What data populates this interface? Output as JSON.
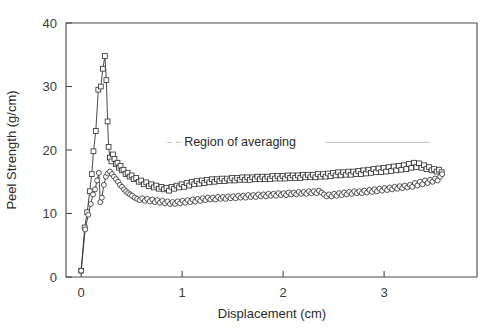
{
  "chart_data": {
    "type": "line",
    "title": "",
    "xlabel": "Displacement (cm)",
    "ylabel": "Peel Strength (g/cm)",
    "xlim": [
      -0.15,
      3.92
    ],
    "ylim": [
      0,
      40
    ],
    "xticks": [
      0,
      1,
      2,
      3
    ],
    "xticklabels": [
      "0",
      "1",
      "2",
      "3"
    ],
    "yticks": [
      0,
      10,
      20,
      30,
      40
    ],
    "yticklabels": [
      "0",
      "10",
      "20",
      "30",
      "40"
    ],
    "grid": false,
    "legend": "none",
    "annotations": [
      {
        "text": "Region of averaging",
        "x": 1.02,
        "y": 21.2,
        "leader_line": true,
        "leader_from_x": 0.85,
        "leader_to_x": 1.0,
        "tail_from_x": 2.42,
        "tail_to_x": 3.45,
        "line_y": 21.2
      }
    ],
    "series": [
      {
        "name": "squares",
        "marker": "square",
        "x": [
          0.0,
          0.035,
          0.06,
          0.085,
          0.105,
          0.122,
          0.145,
          0.17,
          0.195,
          0.215,
          0.235,
          0.25,
          0.262,
          0.272,
          0.285,
          0.3,
          0.315,
          0.33,
          0.345,
          0.36,
          0.375,
          0.39,
          0.405,
          0.42,
          0.44,
          0.46,
          0.48,
          0.5,
          0.52,
          0.545,
          0.57,
          0.595,
          0.62,
          0.645,
          0.67,
          0.695,
          0.72,
          0.745,
          0.77,
          0.795,
          0.82,
          0.845,
          0.87,
          0.895,
          0.92,
          0.945,
          0.97,
          0.995,
          1.02,
          1.045,
          1.07,
          1.095,
          1.12,
          1.145,
          1.17,
          1.195,
          1.22,
          1.245,
          1.27,
          1.295,
          1.32,
          1.345,
          1.37,
          1.395,
          1.42,
          1.445,
          1.47,
          1.495,
          1.52,
          1.545,
          1.57,
          1.595,
          1.62,
          1.645,
          1.67,
          1.695,
          1.72,
          1.745,
          1.77,
          1.795,
          1.82,
          1.845,
          1.87,
          1.895,
          1.92,
          1.945,
          1.97,
          1.995,
          2.02,
          2.045,
          2.07,
          2.095,
          2.12,
          2.145,
          2.17,
          2.195,
          2.22,
          2.245,
          2.27,
          2.295,
          2.32,
          2.345,
          2.37,
          2.395,
          2.42,
          2.445,
          2.47,
          2.495,
          2.52,
          2.545,
          2.57,
          2.595,
          2.62,
          2.645,
          2.67,
          2.695,
          2.72,
          2.745,
          2.77,
          2.795,
          2.82,
          2.845,
          2.87,
          2.895,
          2.92,
          2.945,
          2.97,
          2.995,
          3.02,
          3.045,
          3.07,
          3.095,
          3.12,
          3.145,
          3.17,
          3.195,
          3.22,
          3.245,
          3.27,
          3.295,
          3.32,
          3.345,
          3.37,
          3.395,
          3.42,
          3.445,
          3.47,
          3.495,
          3.52,
          3.545,
          3.57
        ],
        "y": [
          1.0,
          7.8,
          10.2,
          13.5,
          16.2,
          19.8,
          23.0,
          29.5,
          30.0,
          32.8,
          34.8,
          31.0,
          24.5,
          20.5,
          18.8,
          18.2,
          19.3,
          18.6,
          17.8,
          18.0,
          17.2,
          17.5,
          16.8,
          16.9,
          16.2,
          16.4,
          15.8,
          16.0,
          15.4,
          15.6,
          15.0,
          15.2,
          14.6,
          14.9,
          14.3,
          14.6,
          14.1,
          14.4,
          13.9,
          14.2,
          13.8,
          14.0,
          13.6,
          14.2,
          13.9,
          14.4,
          14.1,
          14.6,
          14.2,
          14.8,
          14.4,
          15.0,
          14.6,
          15.1,
          14.7,
          15.2,
          14.8,
          15.3,
          14.9,
          15.4,
          15.0,
          15.4,
          15.1,
          15.5,
          15.1,
          15.5,
          15.2,
          15.6,
          15.2,
          15.6,
          15.3,
          15.7,
          15.3,
          15.7,
          15.3,
          15.7,
          15.4,
          15.8,
          15.4,
          15.8,
          15.4,
          15.8,
          15.4,
          15.9,
          15.5,
          15.9,
          15.5,
          15.9,
          15.5,
          16.0,
          15.6,
          16.0,
          15.6,
          16.0,
          15.6,
          16.1,
          15.7,
          16.1,
          15.7,
          16.1,
          15.7,
          16.2,
          15.8,
          16.2,
          15.8,
          16.3,
          15.9,
          16.4,
          16.0,
          16.5,
          16.0,
          16.5,
          16.1,
          16.6,
          16.1,
          16.6,
          16.2,
          16.7,
          16.2,
          16.8,
          16.3,
          16.9,
          16.4,
          17.0,
          16.5,
          17.1,
          16.5,
          17.2,
          16.6,
          17.3,
          16.7,
          17.4,
          16.8,
          17.5,
          16.9,
          17.6,
          17.0,
          17.8,
          17.2,
          18.0,
          17.3,
          17.9,
          17.2,
          17.6,
          17.0,
          17.3,
          16.8,
          17.0,
          16.6,
          16.9,
          16.5
        ]
      },
      {
        "name": "circles",
        "marker": "circle",
        "x": [
          0.0,
          0.04,
          0.07,
          0.095,
          0.118,
          0.138,
          0.158,
          0.175,
          0.19,
          0.205,
          0.225,
          0.245,
          0.265,
          0.285,
          0.305,
          0.325,
          0.345,
          0.365,
          0.385,
          0.405,
          0.425,
          0.445,
          0.465,
          0.485,
          0.505,
          0.53,
          0.555,
          0.58,
          0.605,
          0.63,
          0.655,
          0.68,
          0.705,
          0.73,
          0.755,
          0.78,
          0.805,
          0.83,
          0.855,
          0.88,
          0.905,
          0.93,
          0.955,
          0.98,
          1.005,
          1.03,
          1.055,
          1.08,
          1.105,
          1.13,
          1.155,
          1.18,
          1.205,
          1.23,
          1.255,
          1.28,
          1.305,
          1.33,
          1.355,
          1.38,
          1.405,
          1.43,
          1.455,
          1.48,
          1.505,
          1.53,
          1.555,
          1.58,
          1.605,
          1.63,
          1.655,
          1.68,
          1.705,
          1.73,
          1.755,
          1.78,
          1.805,
          1.83,
          1.855,
          1.88,
          1.905,
          1.93,
          1.955,
          1.98,
          2.005,
          2.03,
          2.055,
          2.08,
          2.105,
          2.13,
          2.155,
          2.18,
          2.205,
          2.23,
          2.255,
          2.28,
          2.305,
          2.33,
          2.355,
          2.38,
          2.405,
          2.43,
          2.455,
          2.48,
          2.505,
          2.53,
          2.555,
          2.58,
          2.605,
          2.63,
          2.655,
          2.68,
          2.705,
          2.73,
          2.755,
          2.78,
          2.805,
          2.83,
          2.855,
          2.88,
          2.905,
          2.93,
          2.955,
          2.98,
          3.005,
          3.03,
          3.055,
          3.08,
          3.105,
          3.13,
          3.155,
          3.18,
          3.205,
          3.23,
          3.255,
          3.28,
          3.305,
          3.33,
          3.355,
          3.38,
          3.405,
          3.43,
          3.455,
          3.48,
          3.505,
          3.53,
          3.555,
          3.575
        ],
        "y": [
          1.0,
          7.5,
          9.8,
          11.5,
          13.0,
          13.8,
          15.2,
          16.4,
          11.8,
          12.5,
          14.5,
          15.8,
          16.3,
          16.6,
          16.2,
          15.8,
          15.4,
          15.0,
          14.5,
          14.2,
          13.8,
          13.5,
          13.2,
          13.0,
          12.8,
          12.5,
          12.3,
          12.1,
          12.4,
          12.0,
          12.3,
          11.9,
          12.2,
          11.8,
          12.1,
          11.7,
          12.0,
          11.6,
          11.9,
          11.5,
          11.8,
          11.5,
          11.9,
          11.6,
          12.0,
          11.7,
          12.1,
          11.8,
          12.2,
          11.9,
          12.3,
          12.0,
          12.4,
          12.1,
          12.5,
          12.2,
          12.5,
          12.2,
          12.6,
          12.3,
          12.6,
          12.3,
          12.7,
          12.4,
          12.7,
          12.4,
          12.8,
          12.5,
          12.8,
          12.5,
          12.9,
          12.6,
          12.9,
          12.6,
          13.0,
          12.7,
          13.0,
          12.7,
          13.1,
          12.8,
          13.1,
          12.8,
          13.2,
          12.9,
          13.2,
          12.9,
          13.3,
          13.0,
          13.3,
          13.0,
          13.4,
          13.1,
          13.4,
          13.1,
          13.5,
          13.2,
          13.5,
          13.2,
          13.6,
          13.3,
          13.0,
          12.7,
          13.0,
          12.7,
          13.1,
          12.8,
          13.2,
          12.9,
          13.3,
          13.0,
          13.4,
          13.1,
          13.5,
          13.2,
          13.5,
          13.2,
          13.6,
          13.3,
          13.7,
          13.4,
          13.8,
          13.5,
          13.9,
          13.6,
          14.0,
          13.7,
          14.1,
          13.8,
          14.2,
          13.9,
          14.3,
          14.0,
          14.4,
          14.1,
          14.5,
          14.2,
          14.8,
          14.4,
          15.0,
          14.6,
          15.2,
          14.8,
          15.3,
          15.0,
          15.5,
          15.2,
          15.8,
          16.2
        ]
      }
    ]
  }
}
